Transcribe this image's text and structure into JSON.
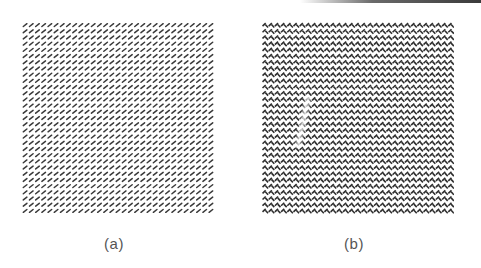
{
  "figure": {
    "panels": [
      {
        "id": "a",
        "caption": "(a)",
        "pattern": "diagonal-dashes",
        "description": "Uniform grid of short forward-slash line segments",
        "grid": {
          "rows": 31,
          "cols": 31
        },
        "mark_color": "#3a3a3a"
      },
      {
        "id": "b",
        "caption": "(b)",
        "pattern": "crossed-weave",
        "description": "Dense grid of interleaved forward and backward slash segments forming a herringbone weave, with a faint light vertical streak",
        "grid": {
          "rows": 31,
          "cols": 31
        },
        "mark_color": "#2e2e2e"
      }
    ]
  }
}
